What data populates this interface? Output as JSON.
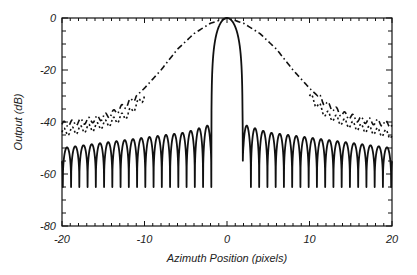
{
  "chart_data": {
    "type": "line",
    "title": "",
    "xlabel": "Azimuth Position (pixels)",
    "ylabel": "Output (dB)",
    "xlim": [
      -20,
      20
    ],
    "ylim": [
      -80,
      0
    ],
    "xticks": [
      -20,
      -10,
      0,
      10,
      20
    ],
    "yticks": [
      0,
      -20,
      -40,
      -60,
      -80
    ],
    "grid": false,
    "legend": null,
    "series": [
      {
        "name": "solid (main lobe with sidelobes)",
        "style": "solid",
        "description": "Narrow main lobe peaking at 0 dB at x=0; first nulls near x=±2; dense sidelobe ripple (about 18 lobes per side) with peaks rising from about -50 dB at x=±20 to about -41 dB near x=±2 and nulls near -65 dB",
        "x": [
          -20,
          -15,
          -10,
          -5,
          -2,
          -1,
          -0.5,
          0,
          0.5,
          1,
          2,
          5,
          10,
          15,
          20
        ],
        "y_peak_envelope": [
          -50,
          -48,
          -46,
          -44,
          -41,
          -8,
          -2,
          0,
          -2,
          -8,
          -41,
          -44,
          -46,
          -48,
          -50
        ],
        "y_null_level": -65
      },
      {
        "name": "dash-dot (broad beam)",
        "style": "dashdot",
        "x": [
          -20,
          -16,
          -14,
          -12,
          -10,
          -8,
          -6,
          -4,
          -2,
          0,
          2,
          4,
          6,
          8,
          10,
          12,
          14,
          16,
          20
        ],
        "y": [
          -41,
          -39,
          -37,
          -33,
          -27,
          -20,
          -12,
          -6,
          -2,
          0,
          -2,
          -6,
          -12,
          -20,
          -27,
          -33,
          -37,
          -39,
          -41
        ]
      },
      {
        "name": "dotted (broad beam, lower)",
        "style": "dotted",
        "x": [
          -20,
          -16,
          -14,
          -12,
          -10,
          10,
          12,
          14,
          16,
          20
        ],
        "y": [
          -44,
          -42,
          -40,
          -37,
          -30,
          -30,
          -37,
          -40,
          -42,
          -45
        ]
      }
    ]
  },
  "axes": {
    "x_title": "Azimuth Position (pixels)",
    "y_title": "Output (dB)",
    "x_tick_labels": [
      "-20",
      "-10",
      "0",
      "10",
      "20"
    ],
    "y_tick_labels": [
      "0",
      "-20",
      "-40",
      "-60",
      "-80"
    ]
  }
}
